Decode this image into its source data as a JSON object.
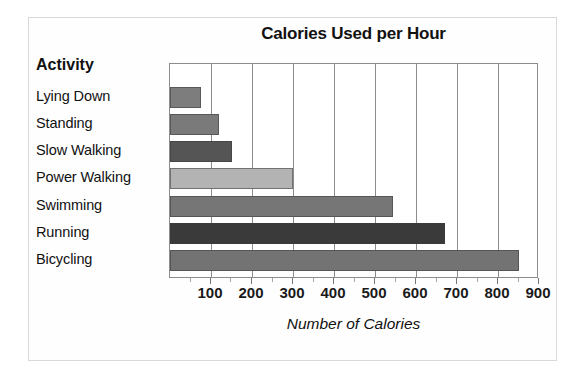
{
  "chart_data": {
    "type": "bar",
    "orientation": "horizontal",
    "title": "Calories Used per Hour",
    "xlabel": "Number of Calories",
    "ylabel": "Activity",
    "categories": [
      "Lying Down",
      "Standing",
      "Slow Walking",
      "Power Walking",
      "Swimming",
      "Running",
      "Bicycling"
    ],
    "values": [
      75,
      120,
      150,
      300,
      545,
      670,
      850
    ],
    "xlim": [
      0,
      900
    ],
    "xticks": [
      100,
      200,
      300,
      400,
      500,
      600,
      700,
      800,
      900
    ],
    "xticklabels": [
      "100",
      "200",
      "300",
      "400",
      "500",
      "600",
      "700",
      "800",
      "900"
    ],
    "grid": "vertical",
    "legend": "none",
    "bar_colors": [
      "#7d7d7d",
      "#7a7a7a",
      "#555555",
      "#b3b3b3",
      "#767676",
      "#3a3a3a",
      "#737373"
    ],
    "plot_border_color": "#8c8c8c",
    "frame_color": "#d9d9d9",
    "background": "#ffffff"
  }
}
